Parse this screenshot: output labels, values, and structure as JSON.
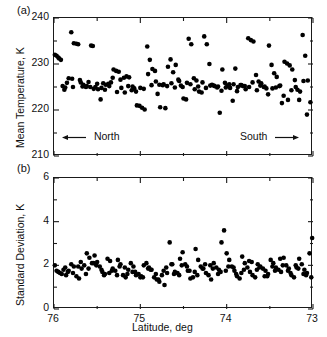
{
  "figure": {
    "panel_a_label": "(a)",
    "panel_b_label": "(b)",
    "annotation_north": "North",
    "annotation_south": "South",
    "arrow_left_icon": "arrow-left-icon",
    "arrow_right_icon": "arrow-right-icon"
  },
  "chart_data": [
    {
      "type": "scatter",
      "panel": "(a)",
      "title": "",
      "xlabel": "",
      "ylabel": "Mean Temperature, K",
      "xlim": [
        76.0,
        73.0
      ],
      "ylim": [
        210,
        240
      ],
      "x_reversed": true,
      "grid": false,
      "legend": "none",
      "xticks": [
        76,
        75,
        74,
        73
      ],
      "xticklabels": [
        "76",
        "75",
        "74",
        "73"
      ],
      "x_minor_ticks": [
        75.5,
        74.5,
        73.5
      ],
      "yticks": [
        210,
        220,
        230,
        240
      ],
      "yticklabels": [
        "210",
        "220",
        "230",
        "240"
      ],
      "y_minor_ticks": [
        215,
        225,
        235
      ],
      "annotations": [
        {
          "text": "North",
          "arrow": "left",
          "x": 75.55,
          "y": 214.2
        },
        {
          "text": "South",
          "arrow": "right",
          "x": 73.42,
          "y": 214.2
        }
      ],
      "marker": "filled-circle",
      "marker_color": "#000000",
      "marker_size_px": 3.4,
      "x": [
        75.99,
        75.97,
        75.95,
        75.94,
        75.92,
        75.9,
        75.87,
        75.83,
        75.8,
        75.77,
        75.74,
        75.72,
        75.69,
        75.66,
        75.63,
        75.6,
        75.57,
        75.55,
        75.52,
        75.49,
        75.46,
        75.43,
        75.4,
        75.37,
        75.34,
        75.31,
        75.28,
        75.25,
        75.22,
        75.19,
        75.16,
        75.13,
        75.1,
        75.07,
        75.04,
        75.01,
        74.98,
        74.95,
        74.92,
        74.89,
        74.86,
        74.83,
        74.8,
        74.77,
        74.74,
        74.71,
        74.68,
        74.65,
        74.62,
        74.59,
        74.56,
        74.53,
        74.5,
        74.47,
        74.44,
        74.41,
        74.38,
        74.35,
        74.32,
        74.29,
        74.26,
        74.23,
        74.2,
        74.17,
        74.14,
        74.11,
        74.08,
        74.05,
        74.02,
        73.99,
        73.96,
        73.93,
        73.9,
        73.87,
        73.84,
        73.81,
        73.78,
        73.75,
        73.72,
        73.69,
        73.66,
        73.63,
        73.6,
        73.57,
        73.54,
        73.51,
        73.48,
        73.45,
        73.42,
        73.39,
        73.36,
        73.33,
        73.3,
        73.27,
        73.24,
        73.21,
        73.18,
        73.15,
        73.12,
        73.09,
        73.06,
        73.03,
        75.85,
        75.78,
        75.7,
        75.62,
        75.54,
        75.45,
        75.36,
        75.27,
        75.18,
        75.09,
        75.0,
        74.91,
        74.82,
        74.73,
        74.64,
        74.55,
        74.46,
        74.37,
        74.28,
        74.19,
        74.1,
        74.01,
        73.92,
        73.83,
        73.74,
        73.65,
        73.56,
        73.47,
        73.38,
        73.29,
        73.2,
        73.11,
        75.88,
        75.79,
        75.67,
        75.58,
        75.5,
        75.41,
        75.32,
        75.23,
        75.14,
        75.05,
        74.96,
        74.87,
        74.78,
        74.69,
        74.6,
        74.51,
        74.42,
        74.33,
        74.24,
        74.15,
        74.06,
        73.97,
        73.88,
        73.79,
        73.7,
        73.61,
        73.52,
        73.43,
        73.34,
        73.25,
        73.16,
        73.07
      ],
      "y": [
        232.0,
        231.8,
        231.4,
        231.2,
        230.9,
        225.2,
        224.9,
        226.9,
        236.9,
        234.5,
        234.4,
        234.3,
        226.0,
        225.5,
        225.0,
        226.1,
        234.0,
        233.9,
        225.0,
        224.5,
        222.3,
        225.8,
        225.5,
        225.7,
        226.0,
        228.8,
        228.5,
        228.3,
        224.8,
        227.0,
        227.3,
        227.1,
        224.3,
        224.7,
        221.0,
        220.9,
        220.5,
        220.1,
        233.8,
        230.9,
        228.9,
        228.5,
        223.5,
        220.6,
        225.4,
        220.4,
        229.4,
        231.0,
        228.2,
        229.8,
        226.6,
        225.3,
        222.5,
        222.3,
        235.5,
        234.3,
        226.9,
        226.4,
        224.0,
        223.8,
        236.0,
        234.3,
        230.0,
        225.5,
        225.2,
        224.9,
        219.4,
        228.8,
        225.9,
        225.3,
        224.8,
        222.0,
        229.0,
        225.0,
        225.4,
        225.2,
        224.5,
        235.6,
        235.2,
        234.9,
        227.6,
        226.2,
        225.8,
        225.0,
        224.7,
        234.0,
        229.8,
        228.0,
        227.2,
        225.2,
        221.5,
        230.5,
        230.1,
        229.7,
        228.8,
        226.5,
        224.4,
        224.0,
        236.3,
        231.8,
        226.4,
        221.7,
        225.9,
        225.0,
        226.5,
        225.2,
        224.6,
        224.8,
        225.2,
        223.9,
        223.8,
        225.1,
        224.8,
        227.8,
        226.2,
        225.6,
        225.8,
        226.3,
        225.9,
        224.5,
        226.0,
        225.3,
        225.1,
        224.9,
        225.6,
        225.4,
        225.0,
        224.3,
        225.1,
        224.7,
        225.3,
        222.2,
        225.0,
        226.3,
        224.4,
        226.8,
        225.1,
        225.0,
        225.7,
        224.4,
        227.0,
        226.6,
        225.2,
        224.0,
        224.6,
        225.4,
        225.5,
        225.2,
        224.9,
        225.0,
        225.6,
        225.1,
        224.8,
        225.3,
        224.2,
        225.6,
        224.1,
        225.2,
        226.0,
        225.3,
        223.4,
        224.9,
        223.1,
        224.3,
        222.2,
        219.0
      ]
    },
    {
      "type": "scatter",
      "panel": "(b)",
      "title": "",
      "xlabel": "Latitude, deg",
      "ylabel": "Standard Deviation, K",
      "xlim": [
        76.0,
        73.0
      ],
      "ylim": [
        0,
        6
      ],
      "x_reversed": true,
      "grid": false,
      "legend": "none",
      "xticks": [
        76,
        75,
        74,
        73
      ],
      "xticklabels": [
        "76",
        "75",
        "74",
        "73"
      ],
      "x_minor_ticks": [
        75.5,
        74.5,
        73.5
      ],
      "yticks": [
        0,
        2,
        4,
        6
      ],
      "yticklabels": [
        "0",
        "2",
        "4",
        "6"
      ],
      "y_minor_ticks": [
        1,
        3,
        5
      ],
      "marker": "filled-circle",
      "marker_color": "#000000",
      "marker_size_px": 3.4,
      "x": [
        75.99,
        75.97,
        75.95,
        75.93,
        75.91,
        75.89,
        75.86,
        75.83,
        75.8,
        75.77,
        75.74,
        75.71,
        75.68,
        75.65,
        75.62,
        75.59,
        75.56,
        75.53,
        75.5,
        75.47,
        75.44,
        75.41,
        75.38,
        75.35,
        75.32,
        75.29,
        75.26,
        75.23,
        75.2,
        75.17,
        75.14,
        75.11,
        75.08,
        75.05,
        75.02,
        74.99,
        74.96,
        74.93,
        74.9,
        74.87,
        74.84,
        74.81,
        74.78,
        74.75,
        74.72,
        74.69,
        74.66,
        74.63,
        74.6,
        74.57,
        74.54,
        74.51,
        74.48,
        74.45,
        74.42,
        74.39,
        74.36,
        74.33,
        74.3,
        74.27,
        74.24,
        74.21,
        74.18,
        74.15,
        74.12,
        74.09,
        74.06,
        74.03,
        74.0,
        73.97,
        73.94,
        73.91,
        73.88,
        73.85,
        73.82,
        73.79,
        73.76,
        73.73,
        73.7,
        73.67,
        73.64,
        73.61,
        73.58,
        73.55,
        73.52,
        73.49,
        73.46,
        73.43,
        73.4,
        73.37,
        73.34,
        73.31,
        73.28,
        73.25,
        73.22,
        73.19,
        73.16,
        73.13,
        73.1,
        73.07,
        73.04,
        73.01,
        75.87,
        75.78,
        75.69,
        75.6,
        75.51,
        75.42,
        75.33,
        75.24,
        75.15,
        75.06,
        74.97,
        74.88,
        74.79,
        74.7,
        74.61,
        74.52,
        74.43,
        74.34,
        74.25,
        74.16,
        74.07,
        73.98,
        73.89,
        73.8,
        73.71,
        73.62,
        73.53,
        73.44,
        73.35,
        73.26,
        73.17,
        73.08,
        75.84,
        75.72,
        75.63,
        75.54,
        75.45,
        75.36,
        75.27,
        75.18,
        75.09,
        75.0,
        74.91,
        74.82,
        74.73,
        74.64,
        74.55,
        74.46,
        74.37,
        74.28,
        74.19,
        74.1,
        74.01,
        73.92,
        73.83,
        73.74,
        73.65,
        73.56,
        73.47,
        73.38,
        73.29,
        73.2,
        73.11,
        73.02
      ],
      "y": [
        2.0,
        1.75,
        1.7,
        1.65,
        1.6,
        1.8,
        1.55,
        1.75,
        2.05,
        1.95,
        1.5,
        1.4,
        1.85,
        2.0,
        2.55,
        2.35,
        2.1,
        2.45,
        2.15,
        1.95,
        1.7,
        1.6,
        2.3,
        2.2,
        1.85,
        1.75,
        2.25,
        2.05,
        1.55,
        1.45,
        1.8,
        2.1,
        1.95,
        1.55,
        1.6,
        1.5,
        2.0,
        2.1,
        1.9,
        1.8,
        1.45,
        1.35,
        1.25,
        1.55,
        1.1,
        1.65,
        3.05,
        2.05,
        1.7,
        1.65,
        2.3,
        2.6,
        2.05,
        1.75,
        1.4,
        1.45,
        2.75,
        2.25,
        1.95,
        1.85,
        1.65,
        1.55,
        1.35,
        2.1,
        1.9,
        1.8,
        3.05,
        3.6,
        2.55,
        2.25,
        1.95,
        1.75,
        1.5,
        1.4,
        2.4,
        2.1,
        1.9,
        1.7,
        1.55,
        1.45,
        2.05,
        1.95,
        1.85,
        1.75,
        1.6,
        2.25,
        2.1,
        1.9,
        1.8,
        1.7,
        2.35,
        2.0,
        1.85,
        1.55,
        1.45,
        1.9,
        2.3,
        2.05,
        1.8,
        1.65,
        2.55,
        3.25,
        1.9,
        1.65,
        2.15,
        1.85,
        2.0,
        1.55,
        1.75,
        1.95,
        1.6,
        1.7,
        1.45,
        1.8,
        1.35,
        1.9,
        1.6,
        2.0,
        1.75,
        1.55,
        2.05,
        1.85,
        1.7,
        1.95,
        1.6,
        1.8,
        2.15,
        1.9,
        1.5,
        1.75,
        2.0,
        1.65,
        1.85,
        1.55,
        1.7,
        1.95,
        1.6,
        2.1,
        1.8,
        1.65,
        1.55,
        1.9,
        1.7,
        1.45,
        1.85,
        1.6,
        1.75,
        2.05,
        1.55,
        1.95,
        1.7,
        1.85,
        2.0,
        1.6,
        1.75,
        1.9,
        1.65,
        2.2,
        1.8,
        1.5,
        1.95,
        2.3,
        1.75,
        2.0,
        1.6,
        1.45
      ]
    }
  ]
}
